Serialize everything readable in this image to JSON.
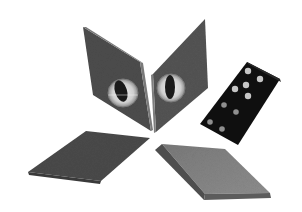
{
  "scene": {
    "description": "Photograph of four grey rhombus-shaped tiles arranged in an X pattern, two upper tiles each bearing a cat-eye marble, plus a black domino with white pips on the right",
    "background": "#ffffff",
    "colors": {
      "tile_dark": "#4a4a4a",
      "tile_mid": "#5a5a5a",
      "tile_light": "#6e6e6e",
      "tile_edge": "#8a8a8a",
      "domino": "#111111",
      "pip": "#bfbfbf",
      "eye_ring": "#d9d9d9",
      "pupil": "#1a1a1a"
    },
    "objects": [
      {
        "name": "upper-left-tile",
        "has_eye": true
      },
      {
        "name": "upper-right-tile",
        "has_eye": true
      },
      {
        "name": "lower-left-tile",
        "has_eye": false
      },
      {
        "name": "lower-right-tile",
        "has_eye": false
      },
      {
        "name": "domino",
        "pip_count": 9
      }
    ]
  }
}
